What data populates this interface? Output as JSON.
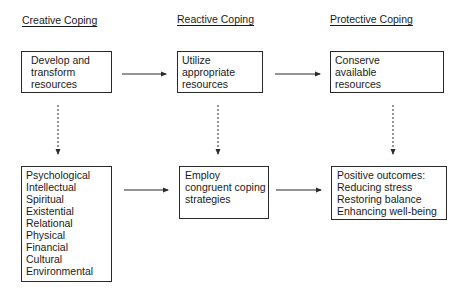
{
  "columns": [
    {
      "heading": "Creative Coping",
      "top_box": [
        "Develop and",
        "transform",
        "resources"
      ],
      "bottom_box": [
        "Psychological",
        "Intellectual",
        "Spiritual",
        "Existential",
        "Relational",
        "Physical",
        "Financial",
        "Cultural",
        "Environmental"
      ]
    },
    {
      "heading": "Reactive Coping",
      "top_box": [
        "Utilize",
        "appropriate",
        "resources"
      ],
      "bottom_box": [
        "Employ",
        "congruent coping",
        "strategies"
      ]
    },
    {
      "heading": "Protective Coping",
      "top_box": [
        "Conserve",
        "available",
        "resources"
      ],
      "bottom_box": [
        "Positive outcomes:",
        "Reducing stress",
        "Restoring balance",
        "Enhancing well-being"
      ]
    }
  ],
  "colors": {
    "line": "#2a2a2a",
    "text": "#1a1a1a"
  }
}
